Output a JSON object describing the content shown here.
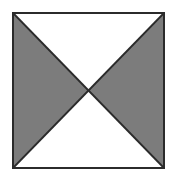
{
  "figure": {
    "name": "bowtie-square-figure",
    "canvas": {
      "width": 174,
      "height": 182,
      "background_color": "#ffffff"
    },
    "square": {
      "x": 13,
      "y": 13,
      "width": 151,
      "height": 155,
      "stroke_color": "#2b2b2b",
      "stroke_width": 2,
      "fill_color": "#ffffff"
    },
    "center_point": {
      "x": 88.5,
      "y": 90.5
    },
    "colors": {
      "shaded": "#7c7c7c",
      "unshaded": "#ffffff",
      "outline": "#2b2b2b"
    },
    "regions": [
      {
        "name": "top-triangle",
        "shade": "white",
        "fill": "#ffffff",
        "points": "13,13 164,13 88.5,90.5"
      },
      {
        "name": "right-triangle",
        "shade": "gray",
        "fill": "#7c7c7c",
        "points": "164,13 164,168 88.5,90.5"
      },
      {
        "name": "bottom-triangle",
        "shade": "white",
        "fill": "#ffffff",
        "points": "164,168 13,168 88.5,90.5"
      },
      {
        "name": "left-triangle",
        "shade": "gray",
        "fill": "#7c7c7c",
        "points": "13,168 13,13 88.5,90.5"
      }
    ],
    "diagonals": [
      {
        "name": "diagonal-tl-br",
        "x1": 13,
        "y1": 13,
        "x2": 164,
        "y2": 168
      },
      {
        "name": "diagonal-tr-bl",
        "x1": 164,
        "y1": 13,
        "x2": 13,
        "y2": 168
      }
    ]
  }
}
